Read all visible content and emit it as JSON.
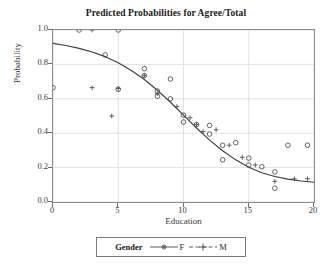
{
  "chart_data": {
    "type": "scatter",
    "title": "Predicted Probabilities for Agree/Total",
    "xlabel": "Education",
    "ylabel": "Probability",
    "xlim": [
      0,
      20
    ],
    "ylim": [
      0.0,
      1.0
    ],
    "grid": true,
    "xticks": [
      0,
      5,
      10,
      15,
      20
    ],
    "xtick_labels": [
      "0",
      "5",
      "10",
      "15",
      "20"
    ],
    "yticks": [
      0.0,
      0.2,
      0.4,
      0.6,
      0.8,
      1.0
    ],
    "ytick_labels": [
      "0.0",
      "0.2",
      "0.4",
      "0.6",
      "0.8",
      "1.0"
    ],
    "legend": {
      "title": "Gender",
      "position": "below-axes",
      "entries": [
        {
          "label": "F",
          "marker": "open-circle",
          "line": "solid"
        },
        {
          "label": "M",
          "marker": "plus",
          "line": "dashed"
        }
      ]
    },
    "series": [
      {
        "name": "F",
        "marker": "open-circle",
        "line": "solid",
        "points": [
          {
            "x": 0.0,
            "y": 0.665
          },
          {
            "x": 2.0,
            "y": 1.0
          },
          {
            "x": 5.0,
            "y": 1.0
          },
          {
            "x": 5.0,
            "y": 0.655
          },
          {
            "x": 4.0,
            "y": 0.855
          },
          {
            "x": 7.0,
            "y": 0.775
          },
          {
            "x": 7.0,
            "y": 0.735
          },
          {
            "x": 9.0,
            "y": 0.715
          },
          {
            "x": 8.0,
            "y": 0.645
          },
          {
            "x": 8.0,
            "y": 0.615
          },
          {
            "x": 9.0,
            "y": 0.6
          },
          {
            "x": 10.0,
            "y": 0.505
          },
          {
            "x": 10.0,
            "y": 0.465
          },
          {
            "x": 11.0,
            "y": 0.45
          },
          {
            "x": 12.0,
            "y": 0.445
          },
          {
            "x": 12.0,
            "y": 0.395
          },
          {
            "x": 13.0,
            "y": 0.33
          },
          {
            "x": 14.0,
            "y": 0.345
          },
          {
            "x": 13.0,
            "y": 0.245
          },
          {
            "x": 15.0,
            "y": 0.255
          },
          {
            "x": 15.0,
            "y": 0.215
          },
          {
            "x": 16.0,
            "y": 0.205
          },
          {
            "x": 17.0,
            "y": 0.175
          },
          {
            "x": 17.0,
            "y": 0.08
          },
          {
            "x": 18.0,
            "y": 0.33
          },
          {
            "x": 19.5,
            "y": 0.33
          }
        ]
      },
      {
        "name": "M",
        "marker": "plus",
        "line": "dashed",
        "points": [
          {
            "x": 3.0,
            "y": 1.0
          },
          {
            "x": 3.0,
            "y": 0.665
          },
          {
            "x": 4.5,
            "y": 0.5
          },
          {
            "x": 5.0,
            "y": 0.66
          },
          {
            "x": 7.0,
            "y": 0.735
          },
          {
            "x": 8.0,
            "y": 0.63
          },
          {
            "x": 9.5,
            "y": 0.555
          },
          {
            "x": 10.5,
            "y": 0.49
          },
          {
            "x": 11.0,
            "y": 0.45
          },
          {
            "x": 11.5,
            "y": 0.41
          },
          {
            "x": 12.5,
            "y": 0.42
          },
          {
            "x": 13.5,
            "y": 0.33
          },
          {
            "x": 14.5,
            "y": 0.26
          },
          {
            "x": 15.5,
            "y": 0.215
          },
          {
            "x": 17.0,
            "y": 0.12
          },
          {
            "x": 18.5,
            "y": 0.135
          },
          {
            "x": 19.5,
            "y": 0.135
          }
        ]
      }
    ],
    "fit_curve": {
      "name": "predicted-probability-curve",
      "line": "solid",
      "points": [
        {
          "x": 0.0,
          "y": 0.922
        },
        {
          "x": 1.0,
          "y": 0.91
        },
        {
          "x": 2.0,
          "y": 0.893
        },
        {
          "x": 3.0,
          "y": 0.872
        },
        {
          "x": 4.0,
          "y": 0.845
        },
        {
          "x": 5.0,
          "y": 0.81
        },
        {
          "x": 6.0,
          "y": 0.765
        },
        {
          "x": 7.0,
          "y": 0.712
        },
        {
          "x": 8.0,
          "y": 0.65
        },
        {
          "x": 9.0,
          "y": 0.58
        },
        {
          "x": 10.0,
          "y": 0.505
        },
        {
          "x": 11.0,
          "y": 0.43
        },
        {
          "x": 12.0,
          "y": 0.36
        },
        {
          "x": 13.0,
          "y": 0.298
        },
        {
          "x": 14.0,
          "y": 0.245
        },
        {
          "x": 15.0,
          "y": 0.202
        },
        {
          "x": 16.0,
          "y": 0.17
        },
        {
          "x": 17.0,
          "y": 0.148
        },
        {
          "x": 18.0,
          "y": 0.133
        },
        {
          "x": 19.0,
          "y": 0.122
        },
        {
          "x": 20.0,
          "y": 0.115
        }
      ]
    },
    "colors": {
      "marker": "#4a4a4a",
      "curve": "#3d3d3d",
      "grid": "#e2e2e2",
      "frame": "#8a8a8a",
      "background": "#ffffff"
    }
  }
}
